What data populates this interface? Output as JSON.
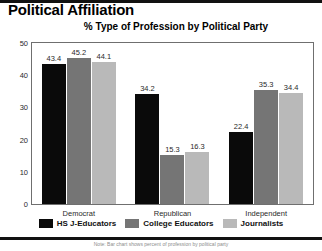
{
  "title": "Political Affiliation",
  "subtitle": "% Type of Profession by Political Party",
  "footnote": "Note: Bar chart shows percent of profession by political party",
  "legend": {
    "items": [
      {
        "label": "HS J-Educators",
        "color": "#0a0a0a"
      },
      {
        "label": "College Educators",
        "color": "#757575"
      },
      {
        "label": "Journalists",
        "color": "#b9b9b9"
      }
    ]
  },
  "yaxis": {
    "ticks": [
      "0",
      "10",
      "20",
      "30",
      "40",
      "50"
    ]
  },
  "chart_data": {
    "type": "bar",
    "title": "% Type of Profession by Political Party",
    "subtitle": "% Type of Profession by Political Party",
    "xlabel": "",
    "ylabel": "",
    "ylim": [
      0,
      50
    ],
    "yticks": [
      0,
      10,
      20,
      30,
      40,
      50
    ],
    "grid": false,
    "legend_position": "bottom",
    "categories": [
      "Democrat",
      "Republican",
      "Independent"
    ],
    "series": [
      {
        "name": "HS J-Educators",
        "color": "#0a0a0a",
        "values": [
          43.4,
          34.2,
          22.4
        ]
      },
      {
        "name": "College Educators",
        "color": "#757575",
        "values": [
          45.2,
          15.3,
          35.3
        ]
      },
      {
        "name": "Journalists",
        "color": "#b9b9b9",
        "values": [
          44.1,
          16.3,
          34.4
        ]
      }
    ],
    "data_labels": [
      [
        "43.4",
        "45.2",
        "44.1"
      ],
      [
        "34.2",
        "15.3",
        "16.3"
      ],
      [
        "22.4",
        "35.3",
        "34.4"
      ]
    ]
  }
}
